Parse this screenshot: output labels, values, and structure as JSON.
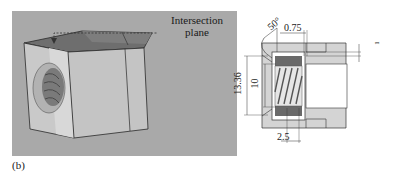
{
  "figure": {
    "label": "(b)",
    "left_panel": {
      "description": "3D rendered square nut block with threaded bore",
      "callout": "Intersection plane",
      "callout_lines": [
        "Intersection",
        "plane"
      ],
      "background_color": "#a9a9a9"
    },
    "right_panel": {
      "description": "Cross-section drawing with dimensions",
      "dimensions": {
        "angle": "50°",
        "top_offset": "0.75",
        "outer_height": "13.36",
        "inner_height": "10",
        "bottom_width": "2.5",
        "right_small": "1"
      }
    }
  }
}
